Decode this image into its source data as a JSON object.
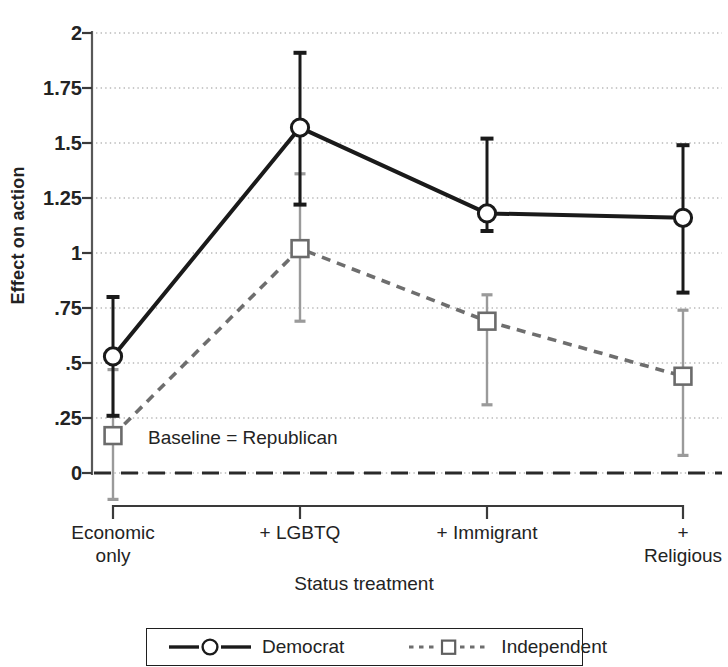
{
  "chart_data": {
    "type": "line",
    "title": "",
    "subtitle": "",
    "xlabel": "Status treatment",
    "ylabel": "Effect on action",
    "categories": [
      "Economic\nonly",
      "+ LGBTQ",
      "+ Immigrant",
      "+ Religious"
    ],
    "x": [
      0,
      1,
      2,
      3
    ],
    "ylim": [
      0,
      2
    ],
    "yticks": [
      0,
      0.25,
      0.5,
      0.75,
      1,
      1.25,
      1.5,
      1.75,
      2
    ],
    "ytick_labels": [
      "0",
      ".25",
      ".5",
      ".75",
      "1",
      "1.25",
      "1.5",
      "1.75",
      "2"
    ],
    "grid": "horizontal-dotted",
    "legend_position": "bottom-outside",
    "annotations": [
      {
        "text": "Baseline = Republican",
        "x": 0.2,
        "y": 0.21
      }
    ],
    "reference_line": {
      "y": 0,
      "style": "dashed",
      "label": "Baseline = Republican"
    },
    "series": [
      {
        "name": "Democrat",
        "marker": "circle-open",
        "line_style": "solid",
        "color": "#1a1a1a",
        "values": [
          0.53,
          1.57,
          1.18,
          1.16
        ],
        "ci_low": [
          0.26,
          1.22,
          1.1,
          0.82
        ],
        "ci_high": [
          0.8,
          1.91,
          1.52,
          1.49
        ]
      },
      {
        "name": "Independent",
        "marker": "square-open",
        "line_style": "dashed",
        "color": "#8a8a8a",
        "values": [
          0.17,
          1.02,
          0.69,
          0.44
        ],
        "ci_low": [
          -0.12,
          0.69,
          0.31,
          0.08
        ],
        "ci_high": [
          0.47,
          1.36,
          0.81,
          0.74
        ]
      }
    ]
  },
  "axes": {
    "y_title": "Effect on action",
    "x_title": "Status treatment",
    "y_tick_labels": [
      "2",
      "1.75",
      "1.5",
      "1.25",
      "1",
      ".75",
      ".5",
      ".25",
      "0"
    ],
    "x_tick_labels": [
      "Economic\nonly",
      "+ LGBTQ",
      "+ Immigrant",
      "+ Religious"
    ]
  },
  "annotation": {
    "baseline_note": "Baseline = Republican"
  },
  "legend": {
    "items": [
      {
        "label": "Democrat",
        "key": "solid-line-circle-marker"
      },
      {
        "label": "Independent",
        "key": "dotted-line-square-marker"
      }
    ]
  }
}
